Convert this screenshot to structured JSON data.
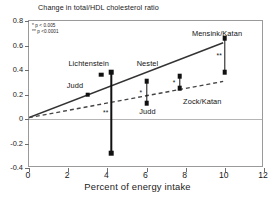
{
  "chart_data": {
    "type": "scatter",
    "title": "Change in total/HDL cholesterol ratio",
    "xlabel": "Percent of energy intake",
    "ylabel": "",
    "xlim": [
      0,
      12
    ],
    "ylim": [
      -0.4,
      0.8
    ],
    "xticks": [
      0,
      2,
      4,
      6,
      8,
      10,
      12
    ],
    "yticks": [
      -0.4,
      -0.2,
      0,
      0.2,
      0.4,
      0.6,
      0.8
    ],
    "xtick_labels": [
      "0",
      "2",
      "4",
      "6",
      "8",
      "10",
      "12"
    ],
    "ytick_labels": [
      "-0.4",
      "-0.2",
      "0",
      "0.2",
      "0.4",
      "0.6",
      "0.8"
    ],
    "grid": false,
    "zero_line": 0,
    "legend_position": "top-left",
    "legend": [
      {
        "marker": "*",
        "label": "* p < 0.005"
      },
      {
        "marker": "**",
        "label": "** p <0.0001"
      }
    ],
    "series": [
      {
        "name": "trans fatty acids trend",
        "type": "line",
        "style": "solid",
        "x": [
          0,
          10
        ],
        "y": [
          0,
          0.62
        ]
      },
      {
        "name": "saturated fatty acids trend",
        "type": "line",
        "style": "dashed",
        "x": [
          0,
          10
        ],
        "y": [
          0,
          0.3
        ]
      }
    ],
    "points": [
      {
        "study": "Judd",
        "x": 3.0,
        "y": 0.2,
        "sig": ""
      },
      {
        "study": "Lichtenstein",
        "x": 3.7,
        "y": 0.36,
        "sig": ""
      },
      {
        "study": "Nestel",
        "x": 4.2,
        "y": 0.38,
        "sig": ""
      },
      {
        "study": "Nestel",
        "x": 4.2,
        "y": -0.28,
        "sig": ""
      },
      {
        "study": "Judd",
        "x": 6.0,
        "y": 0.31,
        "sig": ""
      },
      {
        "study": "Judd",
        "x": 6.0,
        "y": 0.13,
        "sig": ""
      },
      {
        "study": "Zock/Katan",
        "x": 7.7,
        "y": 0.35,
        "sig": ""
      },
      {
        "study": "Zock/Katan",
        "x": 7.7,
        "y": 0.25,
        "sig": ""
      },
      {
        "study": "Mensink/Katan",
        "x": 10.0,
        "y": 0.66,
        "sig": ""
      },
      {
        "study": "Mensink/Katan",
        "x": 10.0,
        "y": 0.38,
        "sig": ""
      }
    ],
    "error_bars": [
      {
        "x": 4.2,
        "y_top": 0.38,
        "y_bottom": -0.28,
        "sig": "**",
        "sig_y": 0.055
      },
      {
        "x": 6.0,
        "y_top": 0.31,
        "y_bottom": 0.13,
        "sig": "*",
        "sig_y": 0.222
      },
      {
        "x": 7.7,
        "y_top": 0.35,
        "y_bottom": 0.25,
        "sig": "*",
        "sig_y": 0.3
      },
      {
        "x": 10.0,
        "y_top": 0.66,
        "y_bottom": 0.38,
        "sig": "**",
        "sig_y": 0.525
      }
    ],
    "annotations": [
      {
        "text": "Lichtenstein",
        "x": 3.05,
        "y": 0.455
      },
      {
        "text": "Nestel",
        "x": 6.05,
        "y": 0.455
      },
      {
        "text": "Judd",
        "x": 2.35,
        "y": 0.275
      },
      {
        "text": "Judd",
        "x": 6.05,
        "y": 0.062
      },
      {
        "text": "Zock/Katan",
        "x": 8.85,
        "y": 0.145
      },
      {
        "text": "Mensink/Katan",
        "x": 9.6,
        "y": 0.705
      }
    ],
    "colors": {
      "marker": "#111111",
      "solid_line": "#333333",
      "dashed_line": "#444444",
      "frame": "#9a9a9a",
      "zero_line": "#b5b5b5",
      "background": "#ffffff"
    }
  }
}
